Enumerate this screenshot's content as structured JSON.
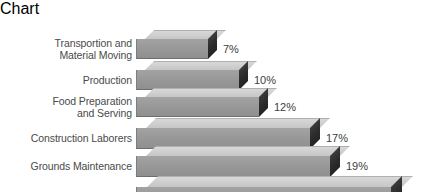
{
  "chart_data": {
    "type": "bar",
    "orientation": "horizontal",
    "title": "",
    "subtitle": "",
    "xlabel": "",
    "ylabel": "",
    "grid": false,
    "legend": null,
    "style": "3d-isometric-bars",
    "value_suffix": "%",
    "xlim": [
      0,
      25
    ],
    "categories": [
      "Transportion and\nMaterial Moving",
      "Production",
      "Food Preparation\nand Serving",
      "Construction Laborers",
      "Grounds Maintenance",
      "Agricultural Workers"
    ],
    "values": [
      7,
      10,
      12,
      17,
      19,
      25
    ],
    "value_labels": [
      "7%",
      "10%",
      "12%",
      "17%",
      "19%",
      "25%"
    ],
    "colors": {
      "bar_front": "#999999",
      "bar_top": "#cccccc",
      "bar_end": "#2b2b2b",
      "label_text": "#4a4a4a",
      "value_text": "#3c3c3c",
      "background": "#ffffff"
    }
  },
  "rows": [
    {
      "label": "Transportion and\nMaterial Moving",
      "value": 7,
      "value_label": "7%",
      "top": 12,
      "height": 20,
      "bar_width": 72,
      "depth": 9
    },
    {
      "label": "Production",
      "value": 10,
      "value_label": "10%",
      "top": 43,
      "height": 20,
      "bar_width": 103,
      "depth": 9
    },
    {
      "label": "Food Preparation\nand Serving",
      "value": 12,
      "value_label": "12%",
      "top": 70,
      "height": 20,
      "bar_width": 123,
      "depth": 9
    },
    {
      "label": "Construction Laborers",
      "value": 17,
      "value_label": "17%",
      "top": 100,
      "height": 21,
      "bar_width": 174,
      "depth": 10
    },
    {
      "label": "Grounds Maintenance",
      "value": 19,
      "value_label": "19%",
      "top": 128,
      "height": 21,
      "bar_width": 194,
      "depth": 10
    },
    {
      "label": "Agricultural Workers",
      "value": 25,
      "value_label": "25%",
      "top": 158,
      "height": 23,
      "bar_width": 255,
      "depth": 11
    }
  ]
}
